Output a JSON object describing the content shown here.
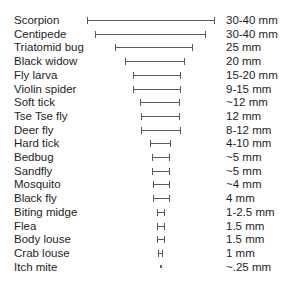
{
  "chart_data": {
    "type": "range-bar",
    "title": "",
    "xlabel": "",
    "ylabel": "",
    "grid": false,
    "legend": null,
    "unit": "mm",
    "categories": [
      "Scorpion",
      "Centipede",
      "Triatomid bug",
      "Black widow",
      "Fly larva",
      "Violin spider",
      "Soft tick",
      "Tse Tse fly",
      "Deer fly",
      "Hard tick",
      "Bedbug",
      "Sandfly",
      "Mosquito",
      "Black fly",
      "Biting midge",
      "Flea",
      "Body louse",
      "Crab louse",
      "Itch mite"
    ],
    "value_labels": [
      "30-40 mm",
      "30-40 mm",
      "25 mm",
      "20 mm",
      "15-20 mm",
      "9-15 mm",
      "~12 mm",
      "12 mm",
      "8-12 mm",
      "4-10 mm",
      "~5 mm",
      "~5 mm",
      "~4 mm",
      "4 mm",
      "1-2.5 mm",
      "1.5 mm",
      "1.5 mm",
      "1 mm",
      "~.25 mm"
    ],
    "bars": [
      {
        "x0": 87,
        "x1": 215
      },
      {
        "x0": 95,
        "x1": 206
      },
      {
        "x0": 115,
        "x1": 193
      },
      {
        "x0": 125,
        "x1": 185
      },
      {
        "x0": 133,
        "x1": 181
      },
      {
        "x0": 133,
        "x1": 181
      },
      {
        "x0": 140,
        "x1": 180
      },
      {
        "x0": 141,
        "x1": 180
      },
      {
        "x0": 141,
        "x1": 181
      },
      {
        "x0": 150,
        "x1": 171
      },
      {
        "x0": 152,
        "x1": 170
      },
      {
        "x0": 152,
        "x1": 170
      },
      {
        "x0": 153,
        "x1": 170
      },
      {
        "x0": 153,
        "x1": 170
      },
      {
        "x0": 157,
        "x1": 165
      },
      {
        "x0": 157,
        "x1": 165
      },
      {
        "x0": 157,
        "x1": 165
      },
      {
        "x0": 158,
        "x1": 163
      },
      {
        "x0": 160,
        "x1": 161
      }
    ],
    "approx_size_mm": [
      [
        30,
        40
      ],
      [
        30,
        40
      ],
      [
        25,
        25
      ],
      [
        20,
        20
      ],
      [
        15,
        20
      ],
      [
        9,
        15
      ],
      [
        12,
        12
      ],
      [
        12,
        12
      ],
      [
        8,
        12
      ],
      [
        4,
        10
      ],
      [
        5,
        5
      ],
      [
        5,
        5
      ],
      [
        4,
        4
      ],
      [
        4,
        4
      ],
      [
        1,
        2.5
      ],
      [
        1.5,
        1.5
      ],
      [
        1.5,
        1.5
      ],
      [
        1,
        1
      ],
      [
        0.25,
        0.25
      ]
    ]
  },
  "rows": [
    {
      "label": "Scorpion",
      "value": "30-40 mm"
    },
    {
      "label": "Centipede",
      "value": "30-40 mm"
    },
    {
      "label": "Triatomid bug",
      "value": "25 mm"
    },
    {
      "label": "Black widow",
      "value": "20 mm"
    },
    {
      "label": "Fly larva",
      "value": "15-20 mm"
    },
    {
      "label": "Violin spider",
      "value": "9-15 mm"
    },
    {
      "label": "Soft tick",
      "value": "~12 mm"
    },
    {
      "label": "Tse Tse fly",
      "value": "12 mm"
    },
    {
      "label": "Deer fly",
      "value": "8-12 mm"
    },
    {
      "label": "Hard tick",
      "value": "4-10 mm"
    },
    {
      "label": "Bedbug",
      "value": "~5 mm"
    },
    {
      "label": "Sandfly",
      "value": "~5 mm"
    },
    {
      "label": "Mosquito",
      "value": "~4 mm"
    },
    {
      "label": "Black fly",
      "value": "4 mm"
    },
    {
      "label": "Biting midge",
      "value": "1-2.5 mm"
    },
    {
      "label": "Flea",
      "value": "1.5 mm"
    },
    {
      "label": "Body louse",
      "value": "1.5 mm"
    },
    {
      "label": "Crab louse",
      "value": "1 mm"
    },
    {
      "label": "Itch mite",
      "value": "~.25 mm"
    }
  ]
}
